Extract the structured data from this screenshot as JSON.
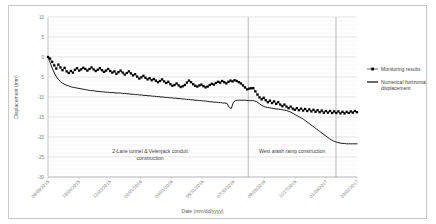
{
  "chart_data": {
    "type": "line",
    "title": "",
    "xlabel": "Date (mm/dd/yyyy)",
    "ylabel": "Displacement (mm)",
    "ylim": [
      -30,
      10
    ],
    "ytick_values": [
      10,
      5,
      0,
      -5,
      -10,
      -15,
      -20,
      -25,
      -30
    ],
    "ytick_labels": [
      "10",
      "5",
      "0",
      "-5",
      "-10",
      "-15",
      "-20",
      "-25",
      "-30"
    ],
    "y_minor_step": 1,
    "grid": true,
    "grid_axis": "y",
    "legend_position": "right",
    "xtick_labels": [
      "08/05/2015",
      "10/04/2015",
      "12/03/2015",
      "02/01/2016",
      "04/01/2016",
      "05/31/2016",
      "07/30/2016",
      "09/28/2016",
      "11/27/2016",
      "01/26/2017",
      "03/02/2017"
    ],
    "xlim_labels": [
      "08/05/2015",
      "03/02/2017"
    ],
    "series": [
      {
        "name": "Monitoring results",
        "style": "line-with-square-markers",
        "color": "#000000",
        "values": [
          0.0,
          -0.4,
          -1.2,
          -2.1,
          -2.9,
          -1.9,
          -2.6,
          -3.3,
          -2.7,
          -3.6,
          -4.0,
          -3.5,
          -3.9,
          -3.2,
          -2.8,
          -3.4,
          -3.1,
          -2.7,
          -3.0,
          -3.4,
          -3.0,
          -2.6,
          -3.1,
          -3.5,
          -3.2,
          -2.8,
          -3.3,
          -3.7,
          -3.4,
          -3.0,
          -3.5,
          -3.9,
          -3.6,
          -4.2,
          -3.8,
          -3.4,
          -3.9,
          -4.4,
          -4.0,
          -3.6,
          -4.1,
          -4.6,
          -4.3,
          -4.9,
          -5.4,
          -5.1,
          -4.7,
          -5.2,
          -5.6,
          -5.3,
          -5.8,
          -5.5,
          -5.9,
          -6.3,
          -6.0,
          -5.6,
          -6.1,
          -6.5,
          -6.2,
          -6.8,
          -7.2,
          -7.0,
          -6.6,
          -7.1,
          -7.5,
          -7.3,
          -7.0,
          -6.4,
          -5.9,
          -6.3,
          -6.8,
          -7.2,
          -7.4,
          -7.1,
          -6.9,
          -7.3,
          -7.6,
          -7.4,
          -7.0,
          -6.7,
          -6.9,
          -6.5,
          -6.2,
          -6.4,
          -6.0,
          -6.3,
          -6.6,
          -6.2,
          -5.9,
          -6.1,
          -5.8,
          -6.0,
          -6.3,
          -6.6,
          -7.1,
          -7.6,
          -8.1,
          -7.9,
          -7.8,
          -7.8,
          -8.6,
          -9.4,
          -10.1,
          -10.6,
          -10.2,
          -10.8,
          -11.3,
          -10.9,
          -11.5,
          -11.1,
          -11.7,
          -11.3,
          -11.9,
          -12.3,
          -11.9,
          -12.4,
          -12.8,
          -12.4,
          -12.9,
          -13.2,
          -12.8,
          -13.3,
          -12.9,
          -13.4,
          -13.0,
          -13.5,
          -13.1,
          -13.6,
          -13.2,
          -13.7,
          -13.3,
          -13.8,
          -13.4,
          -13.9,
          -13.5,
          -13.9,
          -13.5,
          -14.0,
          -13.6,
          -14.0,
          -13.6,
          -14.1,
          -13.7,
          -14.1,
          -13.7,
          -14.0,
          -13.6,
          -13.9,
          -13.5,
          -13.8
        ]
      },
      {
        "name": "Numerical horizontal displacement",
        "style": "solid-line",
        "color": "#1a1a1a",
        "values": [
          0.0,
          -1.4,
          -2.8,
          -4.0,
          -5.0,
          -5.7,
          -6.2,
          -6.6,
          -6.9,
          -7.1,
          -7.3,
          -7.5,
          -7.6,
          -7.7,
          -7.8,
          -7.9,
          -8.0,
          -8.1,
          -8.2,
          -8.3,
          -8.4,
          -8.4,
          -8.5,
          -8.6,
          -8.6,
          -8.7,
          -8.7,
          -8.8,
          -8.8,
          -8.9,
          -8.9,
          -8.9,
          -9.0,
          -9.0,
          -9.0,
          -9.1,
          -9.1,
          -9.2,
          -9.2,
          -9.3,
          -9.3,
          -9.4,
          -9.4,
          -9.5,
          -9.5,
          -9.6,
          -9.6,
          -9.7,
          -9.7,
          -9.8,
          -9.8,
          -9.9,
          -9.9,
          -10.0,
          -10.0,
          -10.1,
          -10.1,
          -10.2,
          -10.2,
          -10.3,
          -10.3,
          -10.4,
          -10.4,
          -10.5,
          -10.5,
          -10.6,
          -10.6,
          -10.7,
          -10.7,
          -10.8,
          -10.8,
          -10.9,
          -10.9,
          -11.0,
          -11.0,
          -11.1,
          -11.2,
          -11.2,
          -11.3,
          -11.3,
          -11.4,
          -11.4,
          -11.5,
          -11.5,
          -11.6,
          -12.6,
          -12.9,
          -11.3,
          -10.9,
          -10.8,
          -10.8,
          -10.8,
          -10.8,
          -10.8,
          -10.9,
          -10.9,
          -10.9,
          -11.0,
          -11.2,
          -11.6,
          -12.0,
          -12.3,
          -12.5,
          -12.6,
          -12.7,
          -12.8,
          -12.9,
          -13.0,
          -13.0,
          -13.1,
          -13.2,
          -13.3,
          -13.4,
          -13.6,
          -13.8,
          -14.1,
          -14.4,
          -14.7,
          -15.0,
          -15.3,
          -15.6,
          -16.0,
          -16.4,
          -16.8,
          -17.2,
          -17.6,
          -18.0,
          -18.4,
          -18.8,
          -19.2,
          -19.6,
          -20.0,
          -20.4,
          -20.7,
          -21.0,
          -21.2,
          -21.4,
          -21.5,
          -21.6,
          -21.6,
          -21.7,
          -21.7,
          -21.7,
          -21.7,
          -21.7,
          -21.7
        ]
      }
    ],
    "annotations": [
      {
        "id": "annotation-left",
        "line1": "2-Lane tunnel & Velenjack conduit",
        "line2": "construction"
      },
      {
        "id": "annotation-right",
        "line1": "West arash ramp construction",
        "line2": ""
      }
    ],
    "dividers": [
      {
        "id": "divider-1",
        "x_fraction": 0.648
      },
      {
        "id": "divider-2",
        "x_fraction": 0.932
      }
    ]
  },
  "legend": {
    "items": [
      {
        "label": "Monitoring results",
        "marker": "square-line",
        "color": "#000000"
      },
      {
        "label": "Numerical horizontal displacement",
        "marker": "line",
        "color": "#1a1a1a"
      }
    ]
  }
}
